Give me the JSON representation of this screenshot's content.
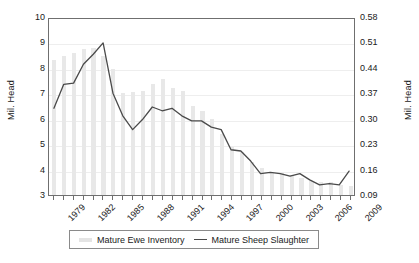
{
  "chart_data": {
    "type": "bar",
    "title": "",
    "xlabel": "",
    "ylabel": "Mil. Head",
    "ylabel_right": "Mil. Head",
    "grid": true,
    "legend_position": "bottom",
    "categories": [
      1979,
      1980,
      1981,
      1982,
      1983,
      1984,
      1985,
      1986,
      1987,
      1988,
      1989,
      1990,
      1991,
      1992,
      1993,
      1994,
      1995,
      1996,
      1997,
      1998,
      1999,
      2000,
      2001,
      2002,
      2003,
      2004,
      2005,
      2006,
      2007,
      2008,
      2009
    ],
    "x_tick_labels": [
      "1979",
      "1982",
      "1985",
      "1988",
      "1991",
      "1994",
      "1997",
      "2000",
      "2003",
      "2006",
      "2009"
    ],
    "y_left": {
      "ticks": [
        "3",
        "4",
        "5",
        "6",
        "7",
        "8",
        "9",
        "10"
      ],
      "min": 3,
      "max": 10
    },
    "y_right": {
      "ticks": [
        "0.09",
        "0.16",
        "0.23",
        "0.30",
        "0.37",
        "0.44",
        "0.51",
        "0.58"
      ],
      "min": 0.09,
      "max": 0.58
    },
    "series": [
      {
        "name": "Mature Ewe Inventory",
        "render": "bar",
        "axis": "left",
        "color": "#e8e8e8",
        "values": [
          8.3,
          8.45,
          8.6,
          8.75,
          8.8,
          8.45,
          7.95,
          7.0,
          7.05,
          7.1,
          7.35,
          7.55,
          7.2,
          7.1,
          6.5,
          6.3,
          6.0,
          5.4,
          4.9,
          4.7,
          4.3,
          4.05,
          3.9,
          3.85,
          3.8,
          3.65,
          3.55,
          3.5,
          3.5,
          3.4,
          3.35
        ]
      },
      {
        "name": "Mature Sheep Slaughter",
        "render": "line",
        "axis": "right",
        "color": "#4a4a4a",
        "values_left_scale": [
          6.45,
          7.4,
          7.45,
          8.2,
          8.6,
          9.05,
          7.05,
          6.15,
          5.6,
          6.0,
          6.5,
          6.35,
          6.45,
          6.15,
          5.95,
          5.95,
          5.7,
          5.6,
          4.8,
          4.75,
          4.35,
          3.85,
          3.9,
          3.85,
          3.75,
          3.85,
          3.6,
          3.4,
          3.45,
          3.4,
          3.95
        ],
        "values": [
          0.33,
          0.4,
          0.4,
          0.45,
          0.48,
          0.51,
          0.37,
          0.31,
          0.27,
          0.3,
          0.33,
          0.32,
          0.33,
          0.31,
          0.3,
          0.3,
          0.28,
          0.27,
          0.22,
          0.21,
          0.18,
          0.15,
          0.15,
          0.15,
          0.14,
          0.15,
          0.13,
          0.12,
          0.12,
          0.12,
          0.16
        ]
      }
    ]
  },
  "legend": {
    "items": [
      {
        "label": "Mature Ewe Inventory",
        "marker": "bar-swatch"
      },
      {
        "label": "Mature Sheep Slaughter",
        "marker": "line-swatch"
      }
    ]
  }
}
